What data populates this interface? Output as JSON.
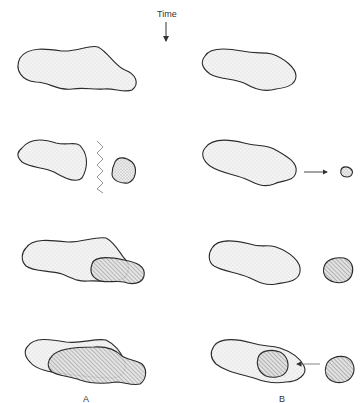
{
  "diagram": {
    "time_label": "Time",
    "columns": [
      {
        "label": "A",
        "description": "Fragmentation followed by reattachment / overlap of detached portion"
      },
      {
        "label": "B",
        "description": "Independent small body approaches, grows, and is engulfed by the larger body"
      }
    ],
    "rows": 4,
    "legend": {
      "stipple": "light stippled body",
      "dense_stipple": "detached fragment",
      "hatched": "hatched body"
    },
    "colors": {
      "outline": "#2b2b2b",
      "stipple_fill": "#f0f0f0",
      "hatch_fill": "#d6d6d6",
      "arrow": "#333333"
    }
  }
}
